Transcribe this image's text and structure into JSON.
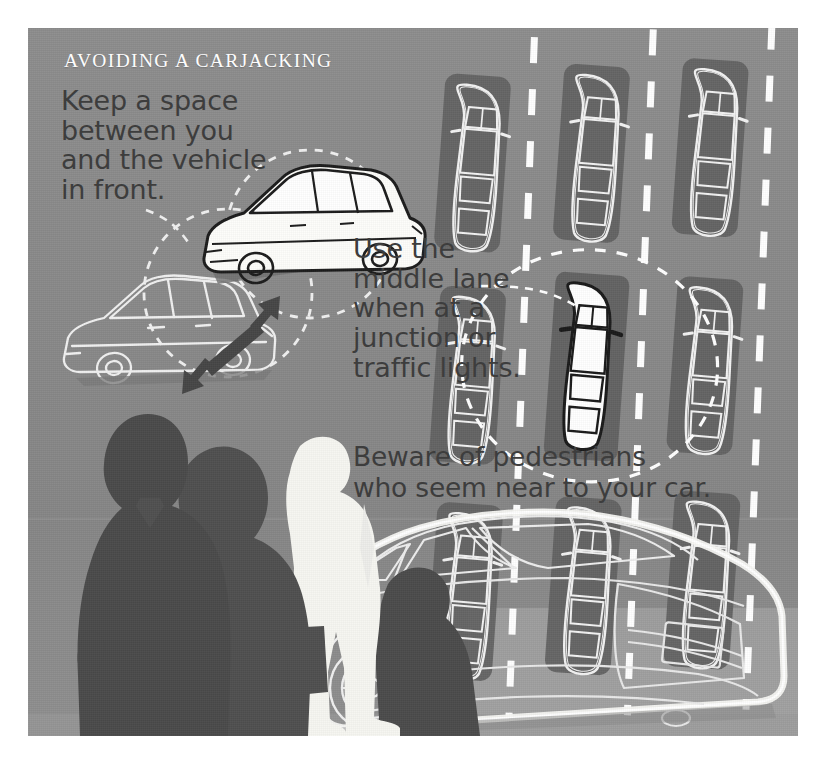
{
  "poster": {
    "title": "AVOIDING A CARJACKING",
    "background_color": "#8b8b8b",
    "border_color": "#ffffff",
    "title_color": "#fdfdfd",
    "body_text_color": "#3d3d3d",
    "accent_white": "#ffffff",
    "silhouette_dark": "#555555",
    "silhouette_light": "#f5f5f0"
  },
  "callouts": [
    {
      "id": "distance",
      "text": "Keep a space\nbetween you\nand the vehicle\nin front.",
      "illustration": "two-cars-with-gap-arrow"
    },
    {
      "id": "lane",
      "text": "Use the\nmiddle lane\nwhen at a\njunction or\ntraffic lights.",
      "illustration": "overhead-traffic-lanes"
    },
    {
      "id": "pedestrians",
      "text": "Beware of pedestrians\nwho seem near to your car.",
      "illustration": "pedestrian-silhouettes-and-car"
    }
  ],
  "illustrations": {
    "distance_diagram": {
      "highlight_car": "white filled hatchback, three-quarter front view",
      "other_car": "white outline hatchback behind",
      "marker": "double-headed arrow between the two cars",
      "halo": "dashed white circles around each car",
      "leader_line": "dashed line from text to diagram"
    },
    "traffic_diagram": {
      "rows": 3,
      "columns": 3,
      "total_cars": 9,
      "highlighted_position": "middle row, middle lane",
      "highlight_style": "solid white with black outline",
      "other_style": "white outline with dark drop shadow",
      "lane_markings": "white dashed lane divider lines",
      "halo": "dashed white ellipse around highlighted car",
      "leader_line": "dashed line from text to highlighted car"
    },
    "pedestrian_scene": {
      "figures": [
        {
          "name": "man-silhouette",
          "tone": "dark"
        },
        {
          "name": "woman-with-handbag-silhouette",
          "tone": "dark"
        },
        {
          "name": "standing-person-silhouette",
          "tone": "light"
        },
        {
          "name": "person-near-car-silhouette",
          "tone": "dark"
        }
      ],
      "car": "white line-drawing sedan, rear three-quarter view"
    }
  }
}
